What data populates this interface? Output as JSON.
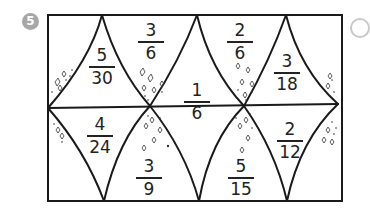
{
  "exercise": {
    "number": "5",
    "colors": {
      "line": "#1a1a1a",
      "badge": "#a7a7a7",
      "speckle": "#333333"
    }
  },
  "fractions": [
    {
      "id": "top-1",
      "numerator": "5",
      "denominator": "30"
    },
    {
      "id": "top-2",
      "numerator": "3",
      "denominator": "6"
    },
    {
      "id": "center",
      "numerator": "1",
      "denominator": "6"
    },
    {
      "id": "top-3",
      "numerator": "2",
      "denominator": "6"
    },
    {
      "id": "top-4",
      "numerator": "3",
      "denominator": "18"
    },
    {
      "id": "bottom-1",
      "numerator": "4",
      "denominator": "24"
    },
    {
      "id": "bottom-2",
      "numerator": "3",
      "denominator": "9"
    },
    {
      "id": "bottom-3",
      "numerator": "5",
      "denominator": "15"
    },
    {
      "id": "bottom-4",
      "numerator": "2",
      "denominator": "12"
    }
  ]
}
